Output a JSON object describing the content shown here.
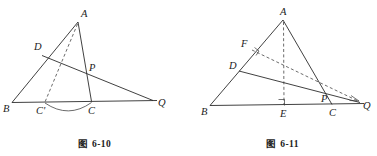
{
  "page": {
    "background": "#ffffff",
    "ink": "#2b2b2b",
    "width": 377,
    "height": 156
  },
  "figures": [
    {
      "id": "fig-6-10",
      "caption_prefix": "图",
      "caption_number": "6-10",
      "caption_full": "图 6-10",
      "labels": {
        "A": "A",
        "B": "B",
        "D": "D",
        "P": "P",
        "C_prime": "C'",
        "C": "C",
        "Q": "Q"
      },
      "points": {
        "A": [
          78,
          21
        ],
        "B": [
          12,
          102
        ],
        "Q": [
          152,
          100
        ],
        "D": [
          43,
          54
        ],
        "C_prime": [
          44,
          102
        ],
        "C": [
          91,
          101
        ],
        "P": [
          87,
          74
        ]
      },
      "elements": [
        "segment-AB",
        "segment-AC",
        "segment-BQ",
        "segment-DQ",
        "dashed-A-to-Cprime",
        "arc-Cprime-to-C"
      ]
    },
    {
      "id": "fig-6-11",
      "caption_prefix": "图",
      "caption_number": "6-11",
      "caption_full": "图 6-11",
      "labels": {
        "A": "A",
        "F": "F",
        "D": "D",
        "B": "B",
        "E": "E",
        "P": "P",
        "C": "C",
        "Q": "Q"
      },
      "points": {
        "A": [
          95,
          19
        ],
        "B": [
          22,
          105
        ],
        "Q": [
          170,
          103
        ],
        "F": [
          62,
          48
        ],
        "D": [
          52,
          70
        ],
        "E": [
          96,
          105
        ],
        "C": [
          143,
          104
        ],
        "P": [
          138,
          98
        ]
      },
      "elements": [
        "segment-AB",
        "segment-AC",
        "segment-BQ",
        "segment-DQ",
        "dashed-altitude-A-to-E",
        "dashed-F-to-Q",
        "right-angle-at-F",
        "right-angle-at-E",
        "arrow-to-Q"
      ]
    }
  ]
}
